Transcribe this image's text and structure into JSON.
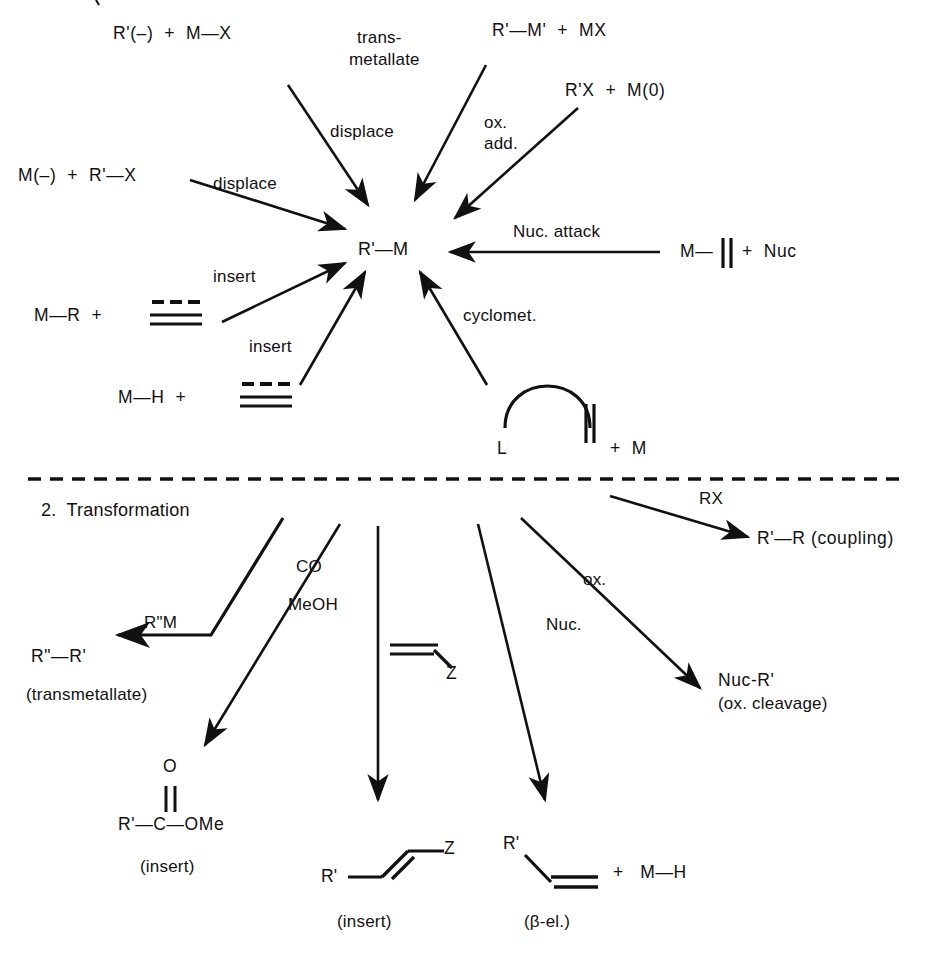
{
  "diagram": {
    "line_color": "#111111",
    "background": "#ffffff",
    "divider": "dashed-horizontal-rule"
  },
  "formation": {
    "center_node": "R'—M",
    "reactants": [
      {
        "id": "rct-carbanion-mx",
        "text": "R'(–)  +  M—X"
      },
      {
        "id": "rct-rm-prime-mx",
        "text": "R'—M'  +  MX"
      },
      {
        "id": "rct-rx-m0",
        "text": "R'X  +  M(0)"
      },
      {
        "id": "rct-metalate-rx",
        "text": "M(–)  +  R'—X"
      },
      {
        "id": "rct-m-alkene-nuc",
        "text": "M—"
      },
      {
        "id": "rct-nuc",
        "text": "+  Nuc"
      },
      {
        "id": "rct-mr-alkene",
        "text": "M—R  +"
      },
      {
        "id": "rct-mh-alkene",
        "text": "M—H  +"
      },
      {
        "id": "rct-ligand-L",
        "text": "L"
      },
      {
        "id": "rct-plus-m",
        "text": "+  M"
      }
    ],
    "arrow_labels": [
      {
        "id": "lbl-transmetallate",
        "line1": "trans-",
        "line2": "metallate"
      },
      {
        "id": "lbl-displace-top",
        "text": "displace"
      },
      {
        "id": "lbl-ox-add",
        "line1": "ox.",
        "line2": "add."
      },
      {
        "id": "lbl-displace-left",
        "text": "displace"
      },
      {
        "id": "lbl-nuc-attack",
        "text": "Nuc. attack"
      },
      {
        "id": "lbl-insert-upper",
        "text": "insert"
      },
      {
        "id": "lbl-insert-lower",
        "text": "insert"
      },
      {
        "id": "lbl-cyclomet",
        "text": "cyclomet."
      }
    ]
  },
  "transformation": {
    "section_label": "2.  Transformation",
    "arrow_labels": [
      {
        "id": "lbl-rdoubleprime-m",
        "text": "R\"M"
      },
      {
        "id": "lbl-co",
        "text": "CO"
      },
      {
        "id": "lbl-meoh",
        "text": "MeOH"
      },
      {
        "id": "lbl-rx",
        "text": "RX"
      },
      {
        "id": "lbl-ox",
        "text": "ox."
      },
      {
        "id": "lbl-nuc",
        "text": "Nuc."
      }
    ],
    "products": [
      {
        "id": "prod-coupling-rr",
        "text": "R'—R (coupling)",
        "caption": ""
      },
      {
        "id": "prod-transmetallate",
        "text": "R\"—R'",
        "caption": "(transmetallate)"
      },
      {
        "id": "prod-nuc-r",
        "text": "Nuc-R'",
        "caption": "(ox. cleavage)"
      },
      {
        "id": "prod-ester",
        "text_o": "O",
        "text_main": "R'—C—OMe",
        "caption": "(insert)"
      },
      {
        "id": "prod-alkene-z",
        "text_r": "R'",
        "text_z": "Z",
        "caption": "(insert)"
      },
      {
        "id": "prod-beta-el",
        "text_r": "R'",
        "text_plus": "+   M—H",
        "caption": "(β-el.)"
      }
    ],
    "alkene_substituent": "Z"
  }
}
